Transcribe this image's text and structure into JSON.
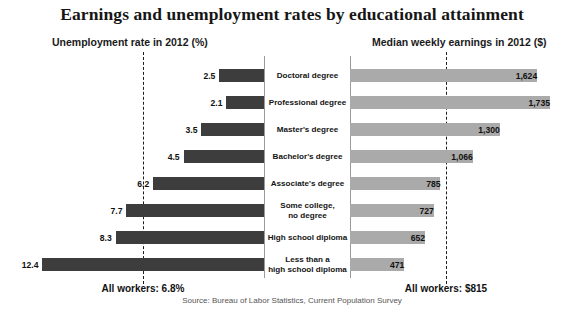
{
  "header": {
    "title": "Earnings and unemployment rates by educational attainment",
    "left_subtitle": "Unemployment rate in 2012 (%)",
    "right_subtitle": "Median weekly earnings in 2012 ($)"
  },
  "footer": {
    "left_note": "All workers: 6.8%",
    "right_note": "All workers: $815",
    "source": "Source: Bureau of Labor Statistics, Current Population Survey"
  },
  "chart_data": {
    "type": "bar",
    "title": "Earnings and unemployment rates by educational attainment",
    "subtitle": "",
    "orientation": "horizontal",
    "layout": "diverging-bidirectional",
    "categories": [
      "Doctoral degree",
      "Professional degree",
      "Master's degree",
      "Bachelor's degree",
      "Associate's degree",
      "Some college,\nno degree",
      "High school diploma",
      "Less than a\nhigh school diploma"
    ],
    "series": [
      {
        "name": "Unemployment rate in 2012 (%)",
        "side": "left",
        "unit": "%",
        "color": "#3d3d3d",
        "values": [
          2.5,
          2.1,
          3.5,
          4.5,
          6.2,
          7.7,
          8.3,
          12.4
        ],
        "labels": [
          "2.5",
          "2.1",
          "3.5",
          "4.5",
          "6.2",
          "7.7",
          "8.3",
          "12.4"
        ],
        "reference_line": {
          "label": "All workers: 6.8%",
          "value": 6.8
        },
        "axis_max": 13.6
      },
      {
        "name": "Median weekly earnings in 2012 ($)",
        "side": "right",
        "unit": "$",
        "color": "#aaaaaa",
        "values": [
          1624,
          1735,
          1300,
          1066,
          785,
          727,
          652,
          471
        ],
        "labels": [
          "1,624",
          "1,735",
          "1,300",
          "1,066",
          "785",
          "727",
          "652",
          "471"
        ],
        "reference_line": {
          "label": "All workers: $815",
          "value": 815
        },
        "axis_max": 1900
      }
    ],
    "xlabel": "",
    "ylabel": "",
    "grid": false,
    "legend": "none",
    "annotations": [
      "All workers: 6.8%",
      "All workers: $815",
      "Source: Bureau of Labor Statistics, Current Population Survey"
    ]
  }
}
